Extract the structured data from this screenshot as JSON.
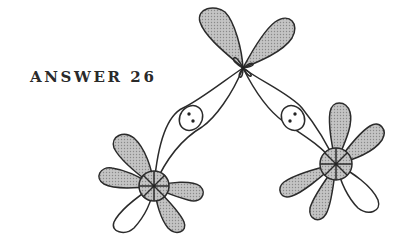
{
  "figure": {
    "label": "ANSWER 26",
    "colors": {
      "line": "#2b2b2b",
      "shade": "#b8b8b8",
      "background": "#ffffff"
    },
    "central_atom": {
      "x": 243,
      "y": 68
    },
    "left_atom": {
      "x": 154,
      "y": 186
    },
    "right_atom": {
      "x": 336,
      "y": 164
    },
    "bond_pairs": [
      {
        "name": "left-bond-electron-pair",
        "x": 191,
        "y": 118,
        "electrons": 2
      },
      {
        "name": "right-bond-electron-pair",
        "x": 293,
        "y": 118,
        "electrons": 2
      }
    ]
  }
}
